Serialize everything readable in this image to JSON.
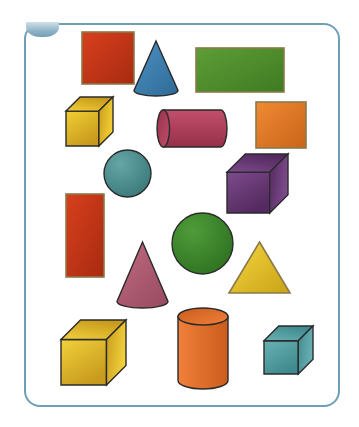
{
  "page": {
    "background_color": "#ffffff",
    "frame": {
      "name": "rounded-panel",
      "border_color": "#6f9fb5",
      "border_radius": 16,
      "x": 24,
      "y": 23,
      "width": 316,
      "height": 384
    },
    "corner_badge": {
      "name": "top-left-badge",
      "color": "#8fb3c6"
    }
  },
  "shapes": [
    {
      "id": "red-square",
      "label": "Square",
      "kind": "square",
      "color": "#d8401d",
      "color_dark": "#a82a10",
      "x": 82,
      "y": 32,
      "w": 52,
      "h": 52
    },
    {
      "id": "blue-cone",
      "label": "Cone",
      "kind": "cone",
      "color": "#4a8fc0",
      "color_dark": "#2f6a97",
      "x": 134,
      "y": 41,
      "w": 44,
      "h": 55
    },
    {
      "id": "green-rectangle",
      "label": "Rectangle",
      "kind": "rectangle",
      "color": "#5d9e36",
      "color_dark": "#3f7a22",
      "x": 196,
      "y": 48,
      "w": 88,
      "h": 44
    },
    {
      "id": "yellow-cube-top",
      "label": "Cube",
      "kind": "cube",
      "color": "#f2cf33",
      "color_dark": "#c79a1d",
      "x": 66,
      "y": 97,
      "w": 47,
      "h": 49
    },
    {
      "id": "rose-cylinder",
      "label": "Cylinder lying down",
      "kind": "cylinder-horizontal",
      "color": "#c14f6b",
      "color_dark": "#97304a",
      "x": 157,
      "y": 110,
      "w": 70,
      "h": 37
    },
    {
      "id": "orange-square",
      "label": "Square",
      "kind": "square",
      "color": "#f08a33",
      "color_dark": "#c9641a",
      "x": 256,
      "y": 102,
      "w": 50,
      "h": 46
    },
    {
      "id": "teal-sphere",
      "label": "Sphere",
      "kind": "sphere",
      "color": "#66a6a6",
      "color_dark": "#3c7a7c",
      "x": 104,
      "y": 150,
      "w": 47,
      "h": 47
    },
    {
      "id": "purple-cube",
      "label": "Cube",
      "kind": "cube",
      "color": "#7c4b8c",
      "color_dark": "#54295f",
      "x": 227,
      "y": 154,
      "w": 61,
      "h": 59
    },
    {
      "id": "red-rectangle-tall",
      "label": "Rectangle",
      "kind": "rectangle",
      "color": "#d8401d",
      "color_dark": "#a82a10",
      "x": 66,
      "y": 194,
      "w": 38,
      "h": 83
    },
    {
      "id": "green-sphere",
      "label": "Sphere",
      "kind": "sphere",
      "color": "#4f9c39",
      "color_dark": "#2f7322",
      "x": 172,
      "y": 213,
      "w": 61,
      "h": 61
    },
    {
      "id": "rose-cone",
      "label": "Cone",
      "kind": "cone",
      "color": "#c0697f",
      "color_dark": "#954a60",
      "x": 117,
      "y": 242,
      "w": 51,
      "h": 66
    },
    {
      "id": "yellow-triangle",
      "label": "Triangle",
      "kind": "triangle",
      "color": "#f6d63f",
      "color_dark": "#c9a317",
      "x": 229,
      "y": 242,
      "w": 61,
      "h": 51
    },
    {
      "id": "yellow-cube-bottom",
      "label": "Cube",
      "kind": "cube",
      "color": "#f2d13b",
      "color_dark": "#c79a1d",
      "x": 61,
      "y": 320,
      "w": 65,
      "h": 65
    },
    {
      "id": "orange-cylinder",
      "label": "Cylinder standing",
      "kind": "cylinder-vertical",
      "color": "#f0803a",
      "color_dark": "#cb5c1c",
      "x": 178,
      "y": 308,
      "w": 50,
      "h": 81
    },
    {
      "id": "teal-cube",
      "label": "Cube",
      "kind": "cube",
      "color": "#69b0b4",
      "color_dark": "#3f8a8e",
      "x": 264,
      "y": 326,
      "w": 49,
      "h": 48
    }
  ]
}
